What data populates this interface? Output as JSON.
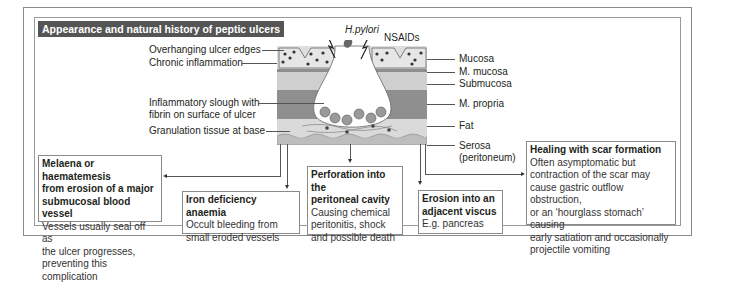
{
  "title": "Appearance and natural history of peptic ulcers",
  "causes": {
    "hpylori": "H.pylori",
    "nsaids": "NSAIDs"
  },
  "left_labels": [
    "Overhanging ulcer edges",
    "Chronic inflammation",
    "Inflammatory slough with",
    "fibrin on surface of ulcer",
    "Granulation tissue at base"
  ],
  "layers": [
    {
      "label": "Mucosa",
      "color": "#dcdcdc"
    },
    {
      "label": "M. mucosa",
      "color": "#8e8e8e"
    },
    {
      "label": "Submucosa",
      "color": "#c9c9c9"
    },
    {
      "label": "M. propria",
      "color": "#8f8f8f"
    },
    {
      "label": "Fat",
      "color": "#d6d6d6"
    },
    {
      "label": "Serosa",
      "sublabel": "(peritoneum)",
      "color": "#bdbdbd"
    }
  ],
  "complications": [
    {
      "heading": [
        "Melaena or haematemesis",
        "from erosion of a major",
        "submucosal blood vessel"
      ],
      "body": [
        "Vessels usually seal off as",
        "the ulcer progresses,",
        "preventing this complication"
      ]
    },
    {
      "heading": [
        "Iron deficiency anaemia"
      ],
      "body": [
        "Occult bleeding from",
        "small eroded vessels"
      ]
    },
    {
      "heading": [
        "Perforation into the",
        "peritoneal cavity"
      ],
      "body": [
        "Causing chemical",
        "peritonitis, shock",
        "and possible death"
      ]
    },
    {
      "heading": [
        "Erosion into an",
        "adjacent viscus"
      ],
      "body": [
        "E.g. pancreas"
      ]
    },
    {
      "heading": [
        "Healing with scar formation"
      ],
      "body": [
        "Often asymptomatic but",
        "contraction of the scar may",
        "cause gastric outflow obstruction,",
        "or an ‘hourglass stomach’ causing",
        "early satiation and occasionally",
        "projectile vomiting"
      ]
    }
  ],
  "colors": {
    "title_bg": "#555555",
    "frame": "#8a8a8a",
    "text": "#231f20"
  }
}
